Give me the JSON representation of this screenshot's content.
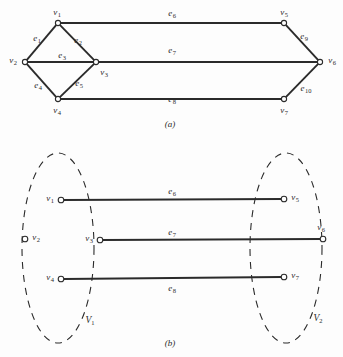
{
  "figure": {
    "panel_a": {
      "caption": "(a)",
      "caption_pos": {
        "x": 170,
        "y": 124
      },
      "vertices": [
        {
          "id": "v1",
          "label": "v",
          "sub": "1",
          "x": 58,
          "y": 23,
          "label_x": 57,
          "label_y": 12
        },
        {
          "id": "v2",
          "label": "v",
          "sub": "2",
          "x": 25,
          "y": 62,
          "label_x": 13,
          "label_y": 60
        },
        {
          "id": "v3",
          "label": "v",
          "sub": "3",
          "x": 96,
          "y": 62,
          "label_x": 104,
          "label_y": 72
        },
        {
          "id": "v4",
          "label": "v",
          "sub": "4",
          "x": 58,
          "y": 99,
          "label_x": 57,
          "label_y": 110
        },
        {
          "id": "v5",
          "label": "v",
          "sub": "5",
          "x": 284,
          "y": 23,
          "label_x": 284,
          "label_y": 12
        },
        {
          "id": "v6",
          "label": "v",
          "sub": "6",
          "x": 320,
          "y": 62,
          "label_x": 332,
          "label_y": 60
        },
        {
          "id": "v7",
          "label": "v",
          "sub": "7",
          "x": 284,
          "y": 99,
          "label_x": 284,
          "label_y": 110
        }
      ],
      "edges": [
        {
          "id": "e1",
          "label": "e",
          "sub": "1",
          "from": "v2",
          "to": "v1",
          "label_x": 37,
          "label_y": 38
        },
        {
          "id": "e2",
          "label": "e",
          "sub": "2",
          "from": "v1",
          "to": "v3",
          "label_x": 78,
          "label_y": 40
        },
        {
          "id": "e3",
          "label": "e",
          "sub": "3",
          "from": "v2",
          "to": "v3",
          "label_x": 62,
          "label_y": 55
        },
        {
          "id": "e4",
          "label": "e",
          "sub": "4",
          "from": "v2",
          "to": "v4",
          "label_x": 38,
          "label_y": 85
        },
        {
          "id": "e5",
          "label": "e",
          "sub": "5",
          "from": "v4",
          "to": "v3",
          "label_x": 79,
          "label_y": 83
        },
        {
          "id": "e6",
          "label": "e",
          "sub": "6",
          "from": "v1",
          "to": "v5",
          "label_x": 172,
          "label_y": 13
        },
        {
          "id": "e7",
          "label": "e",
          "sub": "7",
          "from": "v3",
          "to": "v6",
          "label_x": 172,
          "label_y": 50
        },
        {
          "id": "e8",
          "label": "e",
          "sub": "8",
          "from": "v4",
          "to": "v7",
          "label_x": 172,
          "label_y": 99
        },
        {
          "id": "e9",
          "label": "e",
          "sub": "9",
          "from": "v5",
          "to": "v6",
          "label_x": 304,
          "label_y": 36
        },
        {
          "id": "e10",
          "label": "e",
          "sub": "10",
          "from": "v6",
          "to": "v7",
          "label_x": 306,
          "label_y": 88
        }
      ]
    },
    "panel_b": {
      "caption": "(b)",
      "caption_pos": {
        "x": 170,
        "y": 343
      },
      "sets": [
        {
          "id": "V1",
          "label": "V",
          "sub": "1",
          "cx": 58,
          "cy": 248,
          "rx": 36,
          "ry": 95,
          "label_x": 90,
          "label_y": 320
        },
        {
          "id": "V2",
          "label": "V",
          "sub": "2",
          "cx": 286,
          "cy": 248,
          "rx": 36,
          "ry": 95,
          "label_x": 318,
          "label_y": 318
        }
      ],
      "vertices": [
        {
          "id": "v1",
          "label": "v",
          "sub": "1",
          "x": 61,
          "y": 200,
          "label_x": 50,
          "label_y": 198
        },
        {
          "id": "v2",
          "label": "v",
          "sub": "2",
          "x": 25,
          "y": 239,
          "label_x": 36,
          "label_y": 237
        },
        {
          "id": "v3",
          "label": "v",
          "sub": "3",
          "x": 100,
          "y": 240,
          "label_x": 89,
          "label_y": 238
        },
        {
          "id": "v4",
          "label": "v",
          "sub": "4",
          "x": 61,
          "y": 279,
          "label_x": 50,
          "label_y": 277
        },
        {
          "id": "v5",
          "label": "v",
          "sub": "5",
          "x": 284,
          "y": 199,
          "label_x": 295,
          "label_y": 197
        },
        {
          "id": "v6",
          "label": "v",
          "sub": "6",
          "x": 323,
          "y": 239,
          "label_x": 321,
          "label_y": 227
        },
        {
          "id": "v7",
          "label": "v",
          "sub": "7",
          "x": 284,
          "y": 277,
          "label_x": 295,
          "label_y": 275
        }
      ],
      "edges": [
        {
          "id": "e6",
          "label": "e",
          "sub": "6",
          "from": "v1",
          "to": "v5",
          "label_x": 172,
          "label_y": 191
        },
        {
          "id": "e7",
          "label": "e",
          "sub": "7",
          "from": "v3",
          "to": "v6",
          "label_x": 172,
          "label_y": 232
        },
        {
          "id": "e8",
          "label": "e",
          "sub": "8",
          "from": "v4",
          "to": "v7",
          "label_x": 172,
          "label_y": 288
        }
      ]
    },
    "style": {
      "edge_color": "#2b2b2b",
      "node_stroke": "#2b2b2b",
      "node_fill": "#ffffff",
      "ellipse_stroke": "#2b2b2b",
      "background": "#fdfdfd"
    }
  }
}
